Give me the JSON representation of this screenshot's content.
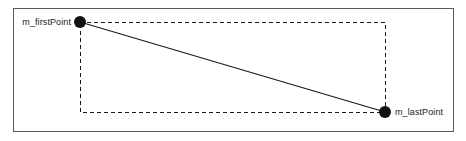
{
  "figure": {
    "title": "",
    "background_color": "#ffffff",
    "frame": {
      "name": "outer-frame",
      "stroke_color": "#5a5a5a",
      "stroke_width": 1,
      "x": 13,
      "y": 8,
      "width": 441,
      "height": 124
    },
    "bounding_box": {
      "name": "dashed-bounding-box",
      "style": "dashed",
      "stroke_color": "#1a1a1a",
      "stroke_width": 1,
      "dash_pattern": "4,3",
      "x": 80,
      "y": 22,
      "width": 305,
      "height": 90
    },
    "segment": {
      "name": "diagonal-segment",
      "style": "solid",
      "stroke_color": "#1a1a1a",
      "stroke_width": 1.1,
      "x1": 80,
      "y1": 22,
      "x2": 385,
      "y2": 112
    },
    "points": [
      {
        "id": "first-point",
        "label": "m_firstPoint",
        "x": 80,
        "y": 22,
        "radius": 6,
        "fill_color": "#111111",
        "label_position": "left"
      },
      {
        "id": "last-point",
        "label": "m_lastPoint",
        "x": 385,
        "y": 112,
        "radius": 6,
        "fill_color": "#111111",
        "label_position": "right"
      }
    ]
  }
}
